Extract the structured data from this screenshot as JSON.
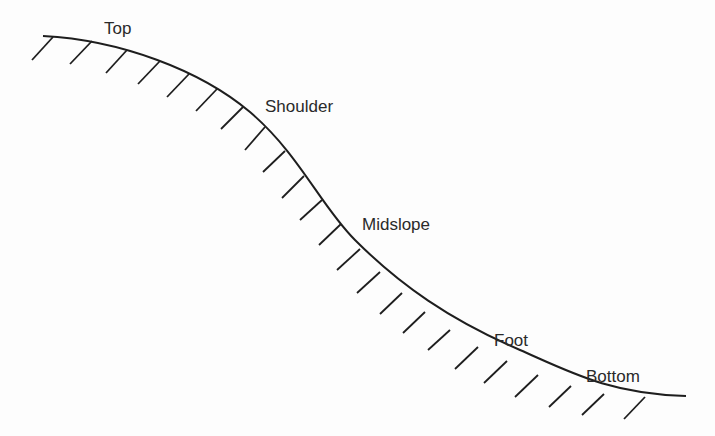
{
  "diagram": {
    "type": "hillslope-profile",
    "stroke_color": "#1e1e1e",
    "text_color": "#2a2a2a",
    "labels": [
      {
        "id": "top",
        "text": "Top",
        "x": 104,
        "y": 20
      },
      {
        "id": "shoulder",
        "text": "Shoulder",
        "x": 265,
        "y": 98
      },
      {
        "id": "midslope",
        "text": "Midslope",
        "x": 362,
        "y": 216
      },
      {
        "id": "foot",
        "text": "Foot",
        "x": 494,
        "y": 332
      },
      {
        "id": "bottom",
        "text": "Bottom",
        "x": 586,
        "y": 368
      }
    ]
  }
}
